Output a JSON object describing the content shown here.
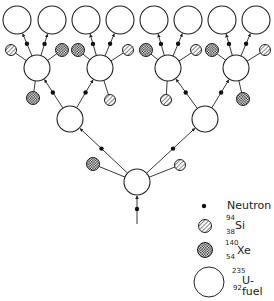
{
  "colors": {
    "stroke": "#222222",
    "background": "#ffffff",
    "neutron": "#111111"
  },
  "legend": {
    "neutron": {
      "label": "Neutron"
    },
    "si": {
      "mass": "94",
      "atomic": "38",
      "symbol": "Si"
    },
    "xe": {
      "mass": "140",
      "atomic": "54",
      "symbol": "Xe"
    },
    "u": {
      "mass": "235",
      "atomic": "92",
      "symbol": "U-fuel"
    }
  },
  "nodes": {
    "tier1": [
      {
        "x": 137,
        "y": 182,
        "r": 13
      }
    ],
    "tier2": [
      {
        "x": 70,
        "y": 119,
        "r": 13
      },
      {
        "x": 205,
        "y": 119,
        "r": 13
      }
    ],
    "tier3": [
      {
        "x": 37,
        "y": 68,
        "r": 13
      },
      {
        "x": 100,
        "y": 68,
        "r": 13
      },
      {
        "x": 168,
        "y": 68,
        "r": 13
      },
      {
        "x": 236,
        "y": 68,
        "r": 13
      }
    ],
    "tier4": [
      {
        "x": 17,
        "y": 20,
        "r": 14
      },
      {
        "x": 52,
        "y": 20,
        "r": 14
      },
      {
        "x": 86,
        "y": 20,
        "r": 14
      },
      {
        "x": 120,
        "y": 20,
        "r": 14
      },
      {
        "x": 154,
        "y": 20,
        "r": 14
      },
      {
        "x": 188,
        "y": 20,
        "r": 14
      },
      {
        "x": 222,
        "y": 20,
        "r": 14
      },
      {
        "x": 256,
        "y": 20,
        "r": 14
      }
    ]
  },
  "fragments": [
    {
      "x": 93,
      "y": 164,
      "type": "xe"
    },
    {
      "x": 180,
      "y": 165,
      "type": "si"
    },
    {
      "x": 33,
      "y": 98,
      "type": "xe"
    },
    {
      "x": 110,
      "y": 100,
      "type": "si"
    },
    {
      "x": 166,
      "y": 100,
      "type": "si"
    },
    {
      "x": 243,
      "y": 99,
      "type": "xe"
    },
    {
      "x": 11,
      "y": 50,
      "type": "si"
    },
    {
      "x": 62,
      "y": 50,
      "type": "xe"
    },
    {
      "x": 78,
      "y": 50,
      "type": "xe"
    },
    {
      "x": 128,
      "y": 50,
      "type": "si"
    },
    {
      "x": 146,
      "y": 50,
      "type": "xe"
    },
    {
      "x": 196,
      "y": 50,
      "type": "si"
    },
    {
      "x": 212,
      "y": 50,
      "type": "xe"
    },
    {
      "x": 265,
      "y": 50,
      "type": "si"
    }
  ]
}
